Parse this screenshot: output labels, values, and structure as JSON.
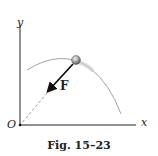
{
  "figure": {
    "caption": "Fig. 15–23",
    "axes": {
      "x_label": "x",
      "y_label": "y",
      "origin_label": "O"
    },
    "force_label": "F",
    "elements": [
      "parabolic trajectory curve",
      "particle (sphere) on trajectory",
      "force vector F pointing toward origin O",
      "dashed line of action from particle to O"
    ]
  },
  "colors": {
    "axes": "#222222",
    "trajectory": "#9a9a9a",
    "force_arrow": "#111111",
    "particle": "#8a8a8a"
  }
}
